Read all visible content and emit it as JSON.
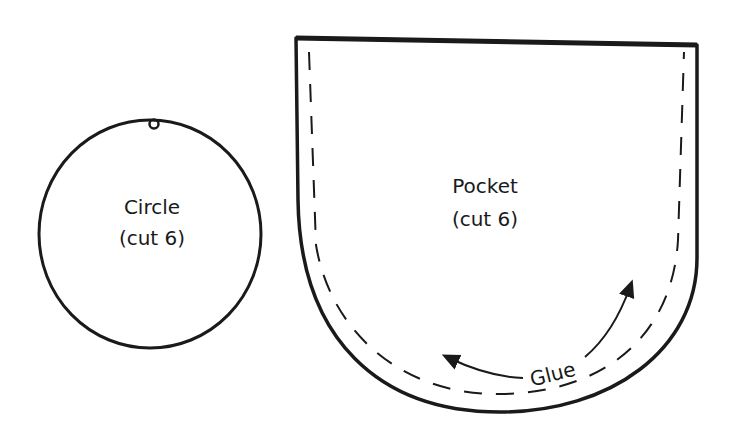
{
  "diagram": {
    "colors": {
      "ink": "#1a1a1a",
      "background": "#ffffff"
    },
    "circle_piece": {
      "title": "Circle",
      "instruction": "(cut 6)",
      "features": [
        "hole-punch"
      ]
    },
    "pocket_piece": {
      "title": "Pocket",
      "instruction": "(cut 6)",
      "glue_label": "Glue",
      "features": [
        "dashed-glue-line",
        "glue-direction-arrows"
      ]
    }
  }
}
